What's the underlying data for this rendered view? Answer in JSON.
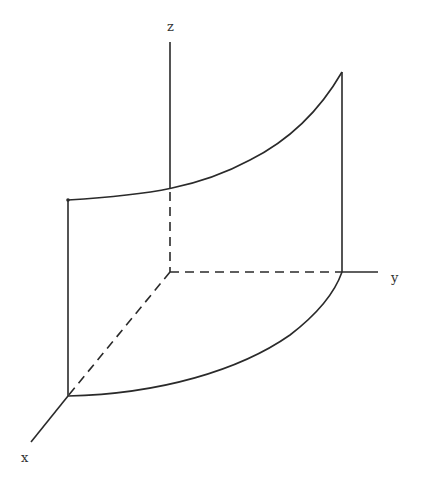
{
  "diagram": {
    "type": "3d-surface-sketch",
    "axes": {
      "x": {
        "label": "x"
      },
      "y": {
        "label": "y"
      },
      "z": {
        "label": "z"
      }
    },
    "colors": {
      "line": "#2a2a2a",
      "background": "#ffffff"
    }
  }
}
